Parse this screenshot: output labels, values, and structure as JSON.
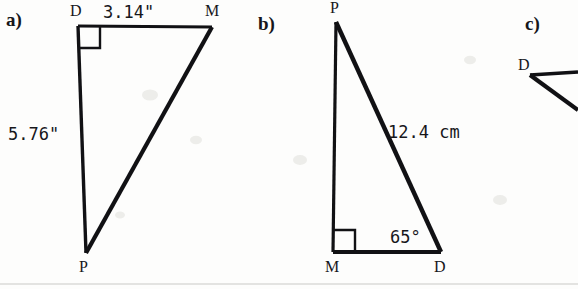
{
  "page": {
    "background_color": "#fdfdfc",
    "ink_color": "#111114",
    "rule_color": "#c9c9c6",
    "width": 578,
    "height": 289,
    "bottom_rule": {
      "y": 284,
      "x1": 0,
      "x2": 578
    }
  },
  "figures": [
    {
      "id": "a",
      "part_label": "a)",
      "part_label_pos": {
        "x": 6,
        "y": 26
      },
      "shape": "right-triangle",
      "vertices": [
        {
          "name": "D",
          "x": 78,
          "y": 26,
          "label_pos": {
            "x": 70,
            "y": 16
          },
          "right_angle": true
        },
        {
          "name": "M",
          "x": 212,
          "y": 27,
          "label_pos": {
            "x": 205,
            "y": 16
          },
          "right_angle": false
        },
        {
          "name": "P",
          "x": 86,
          "y": 253,
          "label_pos": {
            "x": 79,
            "y": 272
          },
          "right_angle": false
        }
      ],
      "measures": [
        {
          "text": "3.14\"",
          "side": "DM",
          "pos": {
            "x": 103,
            "y": 18
          },
          "anchor": "start"
        },
        {
          "text": "5.76\"",
          "side": "DP",
          "pos": {
            "x": 8,
            "y": 140
          },
          "anchor": "start"
        }
      ],
      "right_angle_mark": {
        "at": "D",
        "size": 22
      },
      "stroke_widths": {
        "DM": 3.0,
        "DP": 3.4,
        "MP": 4.2
      }
    },
    {
      "id": "b",
      "part_label": "b)",
      "part_label_pos": {
        "x": 258,
        "y": 30
      },
      "shape": "right-triangle",
      "vertices": [
        {
          "name": "P",
          "x": 336,
          "y": 22,
          "label_pos": {
            "x": 330,
            "y": 13
          },
          "right_angle": false
        },
        {
          "name": "M",
          "x": 333,
          "y": 252,
          "label_pos": {
            "x": 325,
            "y": 272
          },
          "right_angle": true
        },
        {
          "name": "D",
          "x": 441,
          "y": 252,
          "label_pos": {
            "x": 434,
            "y": 272
          },
          "right_angle": false
        }
      ],
      "measures": [
        {
          "text": "12.4 cm",
          "side": "PD",
          "pos": {
            "x": 388,
            "y": 138
          },
          "anchor": "start"
        }
      ],
      "angles": [
        {
          "text": "65°",
          "at": "D",
          "pos": {
            "x": 390,
            "y": 243
          },
          "anchor": "start"
        }
      ],
      "right_angle_mark": {
        "at": "M",
        "size": 22
      },
      "stroke_widths": {
        "PM": 3.2,
        "MD": 4.0,
        "PD": 4.4
      }
    },
    {
      "id": "c",
      "part_label": "c)",
      "part_label_pos": {
        "x": 525,
        "y": 30
      },
      "shape": "partial-triangle-cropped",
      "cropped": true,
      "vertices": [
        {
          "name": "D",
          "x": 530,
          "y": 75,
          "label_pos": {
            "x": 518,
            "y": 70
          },
          "right_angle": false
        }
      ],
      "rays": [
        {
          "from": "D",
          "to": {
            "x": 578,
            "y": 72
          },
          "stroke_width": 3.4
        },
        {
          "from": "D",
          "to": {
            "x": 578,
            "y": 110
          },
          "stroke_width": 4.2
        }
      ],
      "measures": [],
      "angles": []
    }
  ],
  "artifacts": {
    "specks": [
      {
        "x": 150,
        "y": 95,
        "r": 8
      },
      {
        "x": 196,
        "y": 140,
        "r": 6
      },
      {
        "x": 300,
        "y": 160,
        "r": 7
      },
      {
        "x": 470,
        "y": 60,
        "r": 6
      },
      {
        "x": 500,
        "y": 200,
        "r": 7
      },
      {
        "x": 120,
        "y": 215,
        "r": 5
      }
    ]
  }
}
